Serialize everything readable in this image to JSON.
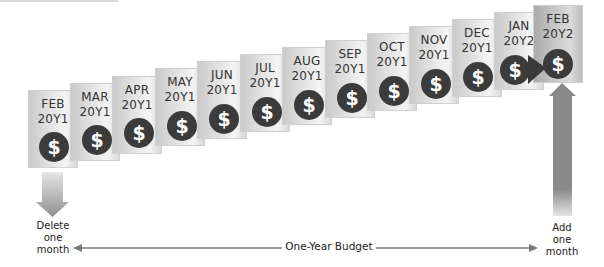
{
  "timeline": {
    "tiles": [
      {
        "month": "FEB",
        "year": "20Y1"
      },
      {
        "month": "MAR",
        "year": "20Y1"
      },
      {
        "month": "APR",
        "year": "20Y1"
      },
      {
        "month": "MAY",
        "year": "20Y1"
      },
      {
        "month": "JUN",
        "year": "20Y1"
      },
      {
        "month": "JUL",
        "year": "20Y1"
      },
      {
        "month": "AUG",
        "year": "20Y1"
      },
      {
        "month": "SEP",
        "year": "20Y1"
      },
      {
        "month": "OCT",
        "year": "20Y1"
      },
      {
        "month": "NOV",
        "year": "20Y1"
      },
      {
        "month": "DEC",
        "year": "20Y1"
      },
      {
        "month": "JAN",
        "year": "20Y2"
      },
      {
        "month": "FEB",
        "year": "20Y2"
      }
    ],
    "coin_symbol": "$"
  },
  "left_arrow": {
    "label_lines": [
      "Delete",
      "one",
      "month"
    ]
  },
  "right_arrow": {
    "label_lines": [
      "Add",
      "one",
      "month"
    ]
  },
  "span": {
    "label": "One-Year Budget"
  },
  "colors": {
    "band": "#3a3a3a",
    "coin": "#3b3b3b",
    "arrow": "#8a8a8a",
    "tile": "#e4e4e4",
    "tile_last": "#c4c4c4"
  }
}
